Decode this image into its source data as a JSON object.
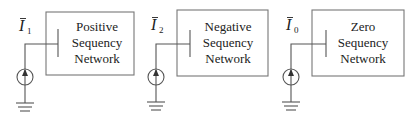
{
  "networks": [
    {
      "current_symbol": "I",
      "current_subscript": "1",
      "label_lines": [
        "Positive",
        "Sequency",
        "Network"
      ],
      "source": "current-source-icon",
      "ground": "ground-icon"
    },
    {
      "current_symbol": "I",
      "current_subscript": "2",
      "label_lines": [
        "Negative",
        "Sequency",
        "Network"
      ],
      "source": "current-source-icon",
      "ground": "ground-icon"
    },
    {
      "current_symbol": "I",
      "current_subscript": "0",
      "label_lines": [
        "Zero",
        "Sequency",
        "Network"
      ],
      "source": "current-source-icon",
      "ground": "ground-icon"
    }
  ],
  "colors": {
    "line": "#555555",
    "box": "#777777",
    "text": "#222222",
    "background": "#ffffff"
  }
}
